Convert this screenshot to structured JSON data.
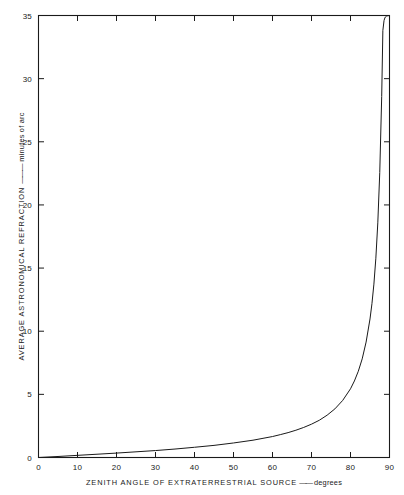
{
  "chart_data": {
    "type": "line",
    "title": "",
    "xlabel": "ZENITH ANGLE OF EXTRATERRESTRIAL SOURCE",
    "xlabel_units": "degrees",
    "ylabel": "AVERAGE ASTRONOMICAL REFRACTION",
    "ylabel_units": "minutes of arc",
    "xlim": [
      0,
      90
    ],
    "ylim": [
      0,
      35
    ],
    "xticks": [
      0,
      10,
      20,
      30,
      40,
      50,
      60,
      70,
      80,
      90
    ],
    "yticks": [
      0,
      5,
      10,
      15,
      20,
      25,
      30,
      35
    ],
    "xtick_labels": [
      "0",
      "10",
      "20",
      "30",
      "40",
      "50",
      "60",
      "70",
      "80",
      "90"
    ],
    "ytick_labels": [
      "0",
      "5",
      "10",
      "15",
      "20",
      "25",
      "30",
      "35"
    ],
    "grid": false,
    "legend": false,
    "frame": "full-box",
    "tick_direction": "in",
    "series": [
      {
        "name": "Average astronomical refraction",
        "line_color": "#1a1a1a",
        "line_width": 1.0,
        "x": [
          0,
          5,
          10,
          15,
          20,
          25,
          30,
          35,
          40,
          45,
          50,
          55,
          60,
          62,
          64,
          66,
          68,
          70,
          72,
          74,
          76,
          78,
          80,
          81,
          82,
          83,
          84,
          85,
          85.5,
          86,
          86.5,
          87,
          87.5,
          88,
          88.3,
          88.6,
          88.8,
          89,
          89.2,
          89.4,
          89.6,
          89.8,
          90
        ],
        "y": [
          0,
          0.08,
          0.17,
          0.26,
          0.35,
          0.45,
          0.55,
          0.67,
          0.81,
          0.96,
          1.15,
          1.37,
          1.66,
          1.81,
          1.97,
          2.16,
          2.38,
          2.64,
          2.95,
          3.35,
          3.85,
          4.52,
          5.44,
          6.06,
          6.83,
          7.81,
          9.14,
          10.97,
          12.18,
          13.73,
          15.78,
          18.58,
          22.57,
          28.58,
          33.82,
          34.6,
          34.8,
          34.9,
          34.95,
          34.97,
          34.98,
          34.99,
          35.0
        ],
        "notes": "Atmospheric refraction R approx 0.96 * tan(z); rises asymptotically toward the horizon and runs off the top of the plot near 90 degrees."
      }
    ],
    "readings": [
      {
        "zenith_angle": 0,
        "refraction": 0.0
      },
      {
        "zenith_angle": 10,
        "refraction": 0.17
      },
      {
        "zenith_angle": 20,
        "refraction": 0.35
      },
      {
        "zenith_angle": 30,
        "refraction": 0.55
      },
      {
        "zenith_angle": 40,
        "refraction": 0.81
      },
      {
        "zenith_angle": 50,
        "refraction": 1.15
      },
      {
        "zenith_angle": 60,
        "refraction": 1.66
      },
      {
        "zenith_angle": 70,
        "refraction": 2.64
      },
      {
        "zenith_angle": 80,
        "refraction": 5.44
      },
      {
        "zenith_angle": 85,
        "refraction": 10.97
      },
      {
        "zenith_angle": 88,
        "refraction": 28.58
      },
      {
        "zenith_angle": 90,
        "refraction": 35.0
      }
    ]
  },
  "colors": {
    "background": "#ffffff",
    "ink": "#1a1a1a",
    "curve": "#1a1a1a"
  }
}
